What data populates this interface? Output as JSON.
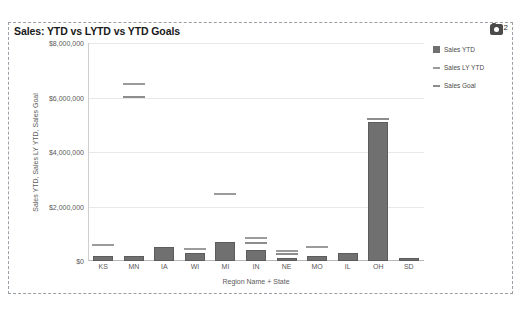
{
  "chart": {
    "title": "Sales: YTD vs LYTD vs YTD Goals",
    "camera_badge_count": "2"
  },
  "legend": {
    "entries": [
      {
        "label": "Sales YTD",
        "marker": "square",
        "color": "#707070"
      },
      {
        "label": "Sales LY YTD",
        "marker": "dash",
        "color": "#9b9b9b"
      },
      {
        "label": "Sales Goal",
        "marker": "dash",
        "color": "#8d8d8d"
      }
    ]
  },
  "chart_data": {
    "type": "bar",
    "title": "Sales: YTD vs LYTD vs YTD Goals",
    "xlabel": "Region Name + State",
    "ylabel": "Sales YTD, Sales LY YTD, Sales Goal",
    "ylim": [
      0,
      8000000
    ],
    "ytick_labels": [
      "$0",
      "$2,000,000",
      "$4,000,000",
      "$6,000,000",
      "$8,000,000"
    ],
    "ytick_values": [
      0,
      2000000,
      4000000,
      6000000,
      8000000
    ],
    "grid": true,
    "legend_position": "right",
    "categories": [
      "KS",
      "MN",
      "IA",
      "WI",
      "MI",
      "IN",
      "NE",
      "MO",
      "IL",
      "OH",
      "SD"
    ],
    "series": [
      {
        "name": "Sales YTD",
        "type": "bar",
        "color": "#707070",
        "values": [
          170000,
          190000,
          510000,
          290000,
          690000,
          400000,
          110000,
          170000,
          290000,
          5100000,
          120000
        ]
      },
      {
        "name": "Sales LY YTD",
        "type": "marker",
        "color": "#9b9b9b",
        "values": [
          560000,
          6450000,
          null,
          400000,
          2420000,
          800000,
          320000,
          470000,
          null,
          null,
          null
        ]
      },
      {
        "name": "Sales Goal",
        "type": "marker",
        "color": "#8d8d8d",
        "values": [
          null,
          5980000,
          null,
          null,
          null,
          620000,
          215000,
          null,
          null,
          5180000,
          null
        ]
      }
    ]
  }
}
